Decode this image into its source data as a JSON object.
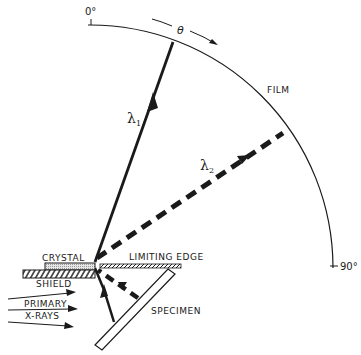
{
  "diagram": {
    "labels": {
      "zero_deg": "0°",
      "ninety_deg": "90°",
      "theta": "θ",
      "film": "FILM",
      "lambda1": "λ",
      "lambda1_sub": "1",
      "lambda2": "λ",
      "lambda2_sub": "2",
      "crystal": "CRYSTAL",
      "limiting_edge": "LIMITING  EDGE",
      "shield": "SHIELD",
      "primary": "PRIMARY",
      "xrays": "X-RAYS",
      "specimen": "SPECIMEN"
    },
    "elements": [
      {
        "id": "film-arc",
        "type": "arc",
        "from_deg": 0,
        "to_deg": 90
      },
      {
        "id": "beam-lambda1",
        "style": "solid",
        "direction": "toward film"
      },
      {
        "id": "beam-lambda2",
        "style": "dashed",
        "direction": "toward film"
      },
      {
        "id": "primary-xrays",
        "count": 3,
        "direction": "right"
      }
    ],
    "colors": {
      "ink": "#1a1a1a",
      "background": "#ffffff",
      "crystal_fill": "#d8d8d8"
    }
  }
}
